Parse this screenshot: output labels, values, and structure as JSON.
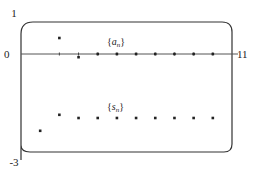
{
  "chart_data": {
    "type": "scatter",
    "title": "",
    "xlabel": "",
    "ylabel": "",
    "xlim": [
      0,
      11
    ],
    "ylim": [
      -3,
      1
    ],
    "grid": false,
    "y_tick_labels": [
      "1",
      "0",
      "-3"
    ],
    "y_ticks": [
      1,
      0,
      -3
    ],
    "x_tick_labels": [
      "11"
    ],
    "x_ticks": [
      11
    ],
    "series": [
      {
        "name": "{a_n}",
        "label_main": "a",
        "label_sub": "n",
        "x": [
          2,
          3,
          4,
          5,
          6,
          7,
          8,
          9,
          10
        ],
        "values": [
          0.5,
          -0.1,
          0,
          0,
          0,
          0,
          0,
          0,
          0
        ]
      },
      {
        "name": "{s_n}",
        "label_main": "s",
        "label_sub": "n",
        "x": [
          1,
          2,
          3,
          4,
          5,
          6,
          7,
          8,
          9,
          10
        ],
        "values": [
          -2.4,
          -1.9,
          -2.0,
          -2.0,
          -2.0,
          -2.0,
          -2.0,
          -2.0,
          -2.0,
          -2.0
        ]
      }
    ],
    "axis_tick_marks_x": [
      2,
      3,
      4,
      5,
      6,
      7,
      8,
      9,
      10
    ]
  }
}
